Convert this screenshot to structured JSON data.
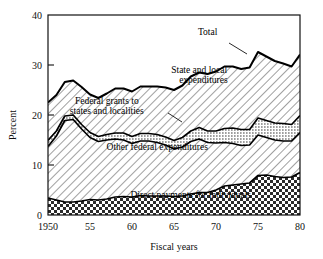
{
  "chart_data": {
    "type": "area",
    "title": "",
    "xlabel": "Fiscal years",
    "ylabel": "Percent",
    "xlim": [
      1950,
      1980
    ],
    "ylim": [
      0,
      40
    ],
    "grid": false,
    "legend_position": "inline-annotations",
    "stacked": true,
    "x": [
      1950,
      1951,
      1952,
      1953,
      1954,
      1955,
      1956,
      1957,
      1958,
      1959,
      1960,
      1961,
      1962,
      1963,
      1964,
      1965,
      1966,
      1967,
      1968,
      1969,
      1970,
      1971,
      1972,
      1973,
      1974,
      1975,
      1976,
      1977,
      1978,
      1979,
      1980
    ],
    "series": [
      {
        "name": "Direct payments for individuals",
        "fill": "checkerboard",
        "values": [
          3.4,
          3.0,
          2.6,
          2.6,
          2.8,
          3.1,
          3.0,
          3.2,
          3.6,
          3.7,
          3.6,
          3.9,
          3.8,
          3.8,
          3.8,
          3.7,
          3.8,
          4.2,
          4.5,
          4.5,
          5.0,
          5.8,
          6.0,
          6.2,
          6.4,
          7.9,
          8.0,
          7.7,
          7.5,
          7.6,
          8.5
        ]
      },
      {
        "name": "Other federal expenditures",
        "fill": "diagonal-hatch",
        "values": [
          10.3,
          12.8,
          16.3,
          16.5,
          14.4,
          12.4,
          11.7,
          11.8,
          11.6,
          11.3,
          10.7,
          10.9,
          11.0,
          10.7,
          10.2,
          9.5,
          9.8,
          10.5,
          10.7,
          10.0,
          9.4,
          8.7,
          8.3,
          7.7,
          7.6,
          8.1,
          7.5,
          7.3,
          7.3,
          7.2,
          8.0
        ]
      },
      {
        "name": "Federal grants to states and localities",
        "fill": "stipple",
        "values": [
          1.2,
          1.0,
          0.9,
          0.9,
          0.9,
          1.0,
          1.0,
          1.1,
          1.2,
          1.4,
          1.4,
          1.5,
          1.5,
          1.6,
          1.6,
          1.7,
          1.9,
          2.1,
          2.3,
          2.3,
          2.4,
          2.8,
          3.1,
          3.2,
          3.1,
          3.4,
          3.4,
          3.4,
          3.5,
          3.3,
          3.4
        ]
      },
      {
        "name": "State and local expenditures",
        "fill": "diagonal-hatch",
        "values": [
          7.6,
          7.2,
          6.8,
          6.9,
          7.5,
          7.6,
          7.7,
          8.2,
          8.9,
          8.9,
          9.0,
          9.4,
          9.4,
          9.6,
          9.9,
          10.1,
          10.4,
          10.9,
          11.0,
          11.4,
          11.9,
          12.4,
          12.3,
          12.1,
          12.4,
          13.2,
          12.8,
          12.4,
          12.0,
          11.6,
          12.2
        ]
      }
    ],
    "total": {
      "name": "Total",
      "values": [
        22.5,
        24.0,
        26.6,
        26.9,
        25.6,
        24.1,
        23.4,
        24.3,
        25.3,
        25.3,
        24.7,
        25.7,
        25.7,
        25.7,
        25.5,
        25.0,
        25.9,
        27.7,
        28.5,
        28.2,
        28.7,
        29.7,
        29.7,
        29.2,
        29.5,
        32.6,
        31.7,
        30.8,
        30.3,
        29.7,
        32.1
      ]
    },
    "y_ticks": [
      0,
      10,
      20,
      30,
      40
    ],
    "y_tick_labels": [
      "0",
      "10",
      "20",
      "30",
      "40"
    ],
    "x_ticks": [
      1950,
      1955,
      1960,
      1965,
      1970,
      1975,
      1980
    ],
    "x_tick_labels": [
      "1950",
      "55",
      "60",
      "65",
      "70",
      "75",
      "80"
    ],
    "annotations": [
      {
        "text": "Total",
        "x": 1969,
        "y": 36.0
      },
      {
        "text": "State and local",
        "x": 1968,
        "y": 28.5
      },
      {
        "text": "expenditures",
        "x": 1968.5,
        "y": 26.4
      },
      {
        "text": "Federal grants to",
        "x": 1957,
        "y": 22.2
      },
      {
        "text": "states and localities",
        "x": 1957,
        "y": 20.2
      },
      {
        "text": "Other federal expenditures",
        "x": 1963,
        "y": 13.0
      },
      {
        "text": "Direct payments for individuals",
        "x": 1967,
        "y": 3.4
      }
    ]
  }
}
